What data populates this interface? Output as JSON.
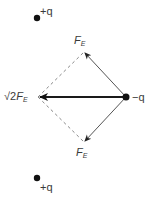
{
  "diagram": {
    "type": "force-vector-diagram",
    "charges": [
      {
        "id": "top",
        "label": "+q",
        "x": 37,
        "y": 18
      },
      {
        "id": "center",
        "label": "−q",
        "x": 126,
        "y": 97
      },
      {
        "id": "bottom",
        "label": "+q",
        "x": 37,
        "y": 178
      }
    ],
    "vectors": [
      {
        "id": "upper-force",
        "label_main": "F",
        "label_sub": "E",
        "from": [
          126,
          97
        ],
        "to": [
          84,
          52
        ],
        "style": "solid-thin"
      },
      {
        "id": "lower-force",
        "label_main": "F",
        "label_sub": "E",
        "from": [
          126,
          97
        ],
        "to": [
          84,
          142
        ],
        "style": "solid-thin"
      },
      {
        "id": "resultant-force",
        "label_prefix": "√2",
        "label_main": "F",
        "label_sub": "E",
        "from": [
          126,
          97
        ],
        "to": [
          38,
          97
        ],
        "style": "solid-thick"
      }
    ],
    "dashed_lines": [
      {
        "from": [
          38,
          97
        ],
        "to": [
          84,
          52
        ]
      },
      {
        "from": [
          38,
          97
        ],
        "to": [
          84,
          142
        ]
      }
    ],
    "colors": {
      "line": "#555555",
      "thick_line": "#1a1a1a",
      "dot": "#111111",
      "dashed": "#888888",
      "text": "#3a3a3a"
    }
  }
}
